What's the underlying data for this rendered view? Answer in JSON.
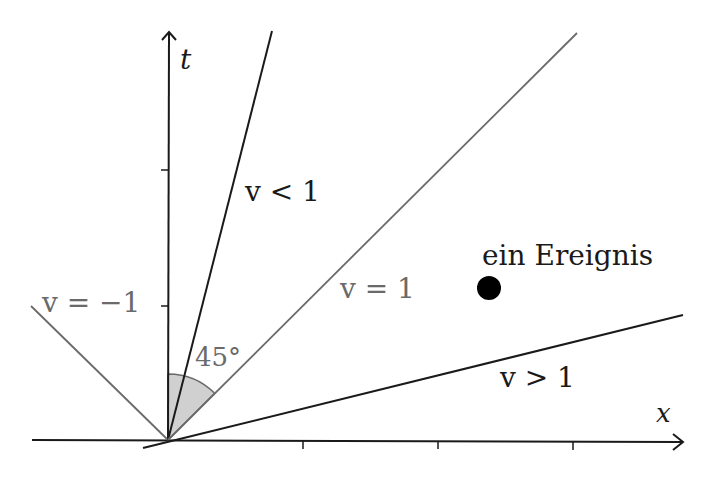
{
  "diagram": {
    "axes": {
      "t_label": "t",
      "x_label": "x"
    },
    "lines": [
      {
        "id": "v-less-1",
        "label": "v < 1",
        "color": "#1a1a1a"
      },
      {
        "id": "v-equal-1",
        "label": "v = 1",
        "color": "#6a6a6a"
      },
      {
        "id": "v-greater-1",
        "label": "v > 1",
        "color": "#1a1a1a"
      },
      {
        "id": "v-minus-1",
        "label": "v = −1",
        "color": "#6a6a6a"
      }
    ],
    "angle_label": "45°",
    "event": {
      "label": "ein Ereignis"
    }
  }
}
